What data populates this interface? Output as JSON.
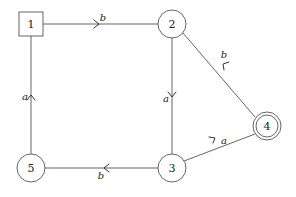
{
  "diagram": {
    "type": "finite-automaton",
    "nodes": [
      {
        "id": "1",
        "label": "1",
        "shape": "square",
        "x": 31,
        "y": 24,
        "role": "initial"
      },
      {
        "id": "2",
        "label": "2",
        "shape": "circle",
        "x": 172,
        "y": 24
      },
      {
        "id": "3",
        "label": "3",
        "shape": "circle",
        "x": 172,
        "y": 168
      },
      {
        "id": "4",
        "label": "4",
        "shape": "double-circle",
        "x": 267,
        "y": 126,
        "role": "accepting"
      },
      {
        "id": "5",
        "label": "5",
        "shape": "circle",
        "x": 31,
        "y": 168
      }
    ],
    "edges": [
      {
        "from": "1",
        "to": "2",
        "label": "b"
      },
      {
        "from": "2",
        "to": "3",
        "label": "a"
      },
      {
        "from": "4",
        "to": "2",
        "label": "b"
      },
      {
        "from": "3",
        "to": "4",
        "label": "a"
      },
      {
        "from": "3",
        "to": "5",
        "label": "b"
      },
      {
        "from": "5",
        "to": "1",
        "label": "a"
      }
    ]
  }
}
